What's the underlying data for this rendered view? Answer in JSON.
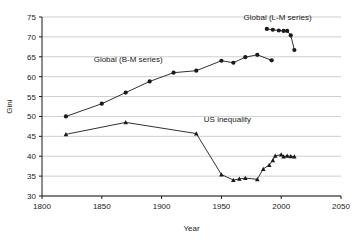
{
  "chart_data": {
    "type": "line",
    "title": "",
    "xlabel": "Year",
    "ylabel": "Gini",
    "xlim": [
      1800,
      2050
    ],
    "ylim": [
      30,
      75
    ],
    "xticks": [
      1800,
      1850,
      1900,
      1950,
      2000,
      2050
    ],
    "yticks": [
      30,
      35,
      40,
      45,
      50,
      55,
      60,
      65,
      70,
      75
    ],
    "grid": "horizontal",
    "legend_position": "inline-annotations",
    "series": [
      {
        "name": "Global (B-M series)",
        "marker": "circle",
        "color": "#1a1a1a",
        "label_x": 1872,
        "label_y": 63.6,
        "x": [
          1820,
          1850,
          1870,
          1890,
          1910,
          1929,
          1950,
          1960,
          1970,
          1980,
          1992
        ],
        "y": [
          50.0,
          53.2,
          56.0,
          58.8,
          61.0,
          61.5,
          64.0,
          63.5,
          64.9,
          65.5,
          64.1
        ]
      },
      {
        "name": "Global (L-M series)",
        "marker": "circle",
        "color": "#1a1a1a",
        "label_x": 1997,
        "label_y": 74.2,
        "x": [
          1988,
          1993,
          1998,
          2002,
          2005,
          2008,
          2011
        ],
        "y": [
          72.0,
          71.8,
          71.6,
          71.5,
          71.5,
          70.4,
          66.7
        ]
      },
      {
        "name": "US inequality",
        "marker": "triangle",
        "color": "#1a1a1a",
        "label_x": 1955,
        "label_y": 48.5,
        "x": [
          1820,
          1870,
          1929,
          1950,
          1960,
          1965,
          1970,
          1980,
          1985,
          1990,
          1993,
          1995,
          2000,
          2002,
          2005,
          2008,
          2011
        ],
        "y": [
          45.5,
          48.5,
          45.7,
          35.4,
          34.0,
          34.3,
          34.5,
          34.2,
          36.8,
          37.8,
          39.0,
          40.1,
          40.4,
          39.9,
          40.1,
          40.0,
          39.9
        ]
      }
    ]
  }
}
